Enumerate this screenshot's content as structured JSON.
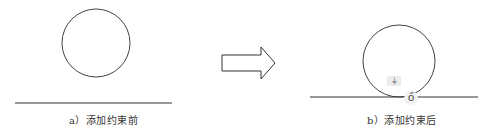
{
  "panels": [
    {
      "id": "a",
      "caption": "a）添加约束前",
      "shapes": [
        "circle",
        "line"
      ],
      "constraint": "none"
    },
    {
      "id": "b",
      "caption": "b）添加约束后",
      "shapes": [
        "circle",
        "line"
      ],
      "constraint": "tangent"
    }
  ],
  "arrow": {
    "direction": "right",
    "meaning": "transition"
  },
  "icons": {
    "fix_icon": "⏚",
    "tangent_icon": "ő"
  },
  "colors": {
    "stroke": "#333333",
    "background": "#ffffff"
  }
}
